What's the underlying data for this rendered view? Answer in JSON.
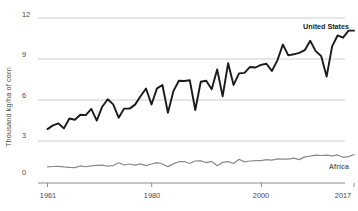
{
  "chart_data": {
    "type": "line",
    "title": "",
    "subtitle": "",
    "xlabel": "",
    "ylabel": "Thousand kg/ha of corn",
    "xlim": [
      1961,
      2017
    ],
    "ylim": [
      0,
      12
    ],
    "grid": true,
    "gridlines_y": [
      0,
      3,
      6,
      9,
      12
    ],
    "ytick_labels": [
      "12",
      "9",
      "6",
      "3",
      "0"
    ],
    "xtick_labels": [
      "1961",
      "1980",
      "2000",
      "2017"
    ],
    "xticks": [
      1961,
      1980,
      2000,
      2017
    ],
    "legend_position": "inline-right",
    "x": [
      1961,
      1962,
      1963,
      1964,
      1965,
      1966,
      1967,
      1968,
      1969,
      1970,
      1971,
      1972,
      1973,
      1974,
      1975,
      1976,
      1977,
      1978,
      1979,
      1980,
      1981,
      1982,
      1983,
      1984,
      1985,
      1986,
      1987,
      1988,
      1989,
      1990,
      1991,
      1992,
      1993,
      1994,
      1995,
      1996,
      1997,
      1998,
      1999,
      2000,
      2001,
      2002,
      2003,
      2004,
      2005,
      2006,
      2007,
      2008,
      2009,
      2010,
      2011,
      2012,
      2013,
      2014,
      2015,
      2016,
      2017
    ],
    "series": [
      {
        "name": "United States",
        "color": "#1a1a1a",
        "values": [
          3.92,
          4.19,
          4.33,
          3.97,
          4.69,
          4.6,
          4.96,
          4.94,
          5.39,
          4.54,
          5.55,
          6.09,
          5.72,
          4.75,
          5.41,
          5.41,
          5.7,
          6.31,
          6.87,
          5.71,
          6.88,
          7.13,
          5.11,
          6.68,
          7.44,
          7.42,
          7.47,
          5.31,
          7.36,
          7.44,
          6.82,
          8.26,
          6.3,
          8.71,
          7.13,
          7.97,
          8.01,
          8.44,
          8.4,
          8.59,
          8.67,
          8.15,
          8.92,
          10.07,
          9.28,
          9.36,
          9.46,
          9.66,
          10.34,
          9.59,
          9.24,
          7.74,
          9.94,
          10.73,
          10.57,
          11.08,
          11.08
        ]
      },
      {
        "name": "Africa",
        "color": "#8a8a8a",
        "values": [
          1.18,
          1.2,
          1.21,
          1.17,
          1.14,
          1.12,
          1.24,
          1.18,
          1.25,
          1.28,
          1.3,
          1.22,
          1.27,
          1.47,
          1.31,
          1.38,
          1.3,
          1.39,
          1.26,
          1.38,
          1.48,
          1.38,
          1.19,
          1.39,
          1.55,
          1.56,
          1.42,
          1.6,
          1.62,
          1.48,
          1.57,
          1.25,
          1.5,
          1.55,
          1.42,
          1.72,
          1.54,
          1.6,
          1.63,
          1.63,
          1.7,
          1.66,
          1.75,
          1.73,
          1.73,
          1.81,
          1.7,
          1.9,
          1.95,
          2.03,
          2.0,
          2.02,
          1.97,
          2.04,
          1.87,
          1.92,
          2.07
        ]
      }
    ],
    "annotations": [
      {
        "name": "United States",
        "text": "United States",
        "x": 2014,
        "y": 11.4
      },
      {
        "name": "Africa",
        "text": "Africa",
        "x": 2013,
        "y": 1.15
      }
    ]
  },
  "axis": {
    "y_title": "Thousand kg/ha of corn",
    "y_ticks": [
      {
        "label": "12",
        "value": 12
      },
      {
        "label": "9",
        "value": 9
      },
      {
        "label": "6",
        "value": 6
      },
      {
        "label": "3",
        "value": 3
      },
      {
        "label": "0",
        "value": 0
      }
    ],
    "x_ticks": [
      {
        "label": "1961",
        "value": 1961
      },
      {
        "label": "1980",
        "value": 1980
      },
      {
        "label": "2000",
        "value": 2000
      },
      {
        "label": "2017",
        "value": 2017
      }
    ]
  },
  "labels": {
    "united_states": "United States",
    "africa": "Africa"
  },
  "colors": {
    "united_states_line": "#1a1a1a",
    "africa_line": "#8a8a8a",
    "gridline": "#c8c8c8",
    "axis": "#8c8c8c",
    "text": "#4a4a4a",
    "background": "#ffffff"
  }
}
